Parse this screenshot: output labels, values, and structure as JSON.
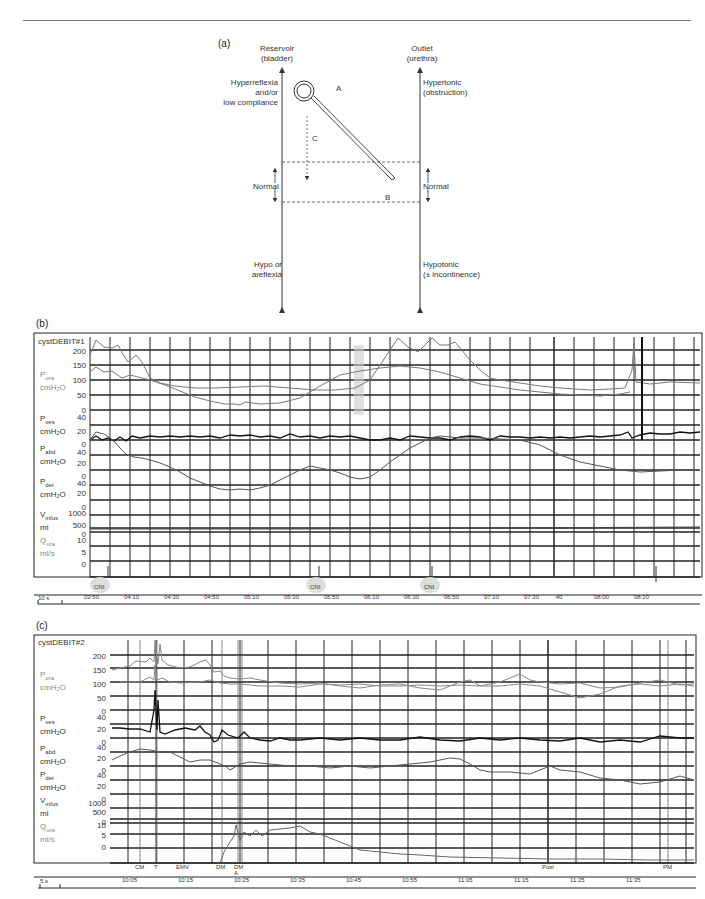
{
  "page": {
    "top_rule": true
  },
  "panel_a": {
    "label": "(a)",
    "left_axis": {
      "title_line1": "Reservoir",
      "title_line2": "(bladder)"
    },
    "right_axis": {
      "title_line1": "Outlet",
      "title_line2": "(urethra)"
    },
    "left_top": [
      "Hyperreflexia",
      "and/or",
      "low compliance"
    ],
    "left_mid": "Normal",
    "left_bottom": [
      "Hypo or",
      "areflexia"
    ],
    "right_top": [
      "Hypertonic",
      "(obstruction)"
    ],
    "right_mid": "Normal",
    "right_bottom": [
      "Hypotonic",
      "(± incontinence)"
    ],
    "markers": {
      "A": "A",
      "B": "B",
      "C": "C"
    }
  },
  "panel_b": {
    "label": "(b)",
    "recording_title": "cystDEBIT#1",
    "channels": [
      {
        "name": "P",
        "sub": "ura",
        "unit": "cmH₂O",
        "ticks": [
          "200",
          "150",
          "100",
          "50",
          "0"
        ],
        "color": "#888888"
      },
      {
        "name": "P",
        "sub": "ves",
        "unit": "cmH₂O",
        "ticks": [
          "40",
          "20",
          "0"
        ],
        "color": "#888888"
      },
      {
        "name": "P",
        "sub": "abd",
        "unit": "cmH₂O",
        "ticks": [
          "40",
          "20",
          "0"
        ],
        "color": "#222222"
      },
      {
        "name": "P",
        "sub": "det",
        "unit": "cmH₂O",
        "ticks": [
          "40",
          "20",
          "0"
        ],
        "color": "#222222"
      },
      {
        "name": "V",
        "sub": "infus",
        "unit": "ml",
        "ticks": [
          "1000",
          "500",
          "0"
        ],
        "color": "#222222"
      },
      {
        "name": "Q",
        "sub": "ura",
        "unit": "ml/s",
        "ticks": [
          "10",
          "5",
          "0"
        ],
        "color": "#888888"
      }
    ],
    "events": [
      {
        "label": "CNI",
        "mark": "CNI"
      },
      {
        "label": "CNI",
        "mark": "CNI"
      },
      {
        "label": "CNI",
        "mark": "CNI"
      },
      {
        "label": "TOUX",
        "mark": "TOUX"
      }
    ],
    "scale_bar": "10 s",
    "time_ticks": [
      "03:50",
      "04:10",
      "04:30",
      "04:50",
      "05:10",
      "05:30",
      "05:50",
      "06:10",
      "06:30",
      "06:50",
      "07:10",
      "07:30",
      ":40",
      "08:00",
      "08:20"
    ],
    "annotation_vertical": "ALITOBEDIENT"
  },
  "panel_c": {
    "label": "(c)",
    "recording_title": "cystDEBIT#2",
    "channels": [
      {
        "name": "P",
        "sub": "ura",
        "unit": "cmH₂O",
        "ticks": [
          "200",
          "150",
          "100",
          "50",
          "0"
        ]
      },
      {
        "name": "P",
        "sub": "ves",
        "unit": "cmH₂O",
        "ticks": [
          "40",
          "20",
          "0"
        ]
      },
      {
        "name": "P",
        "sub": "abd",
        "unit": "cmH₂O",
        "ticks": [
          "40",
          "20",
          "0"
        ]
      },
      {
        "name": "P",
        "sub": "det",
        "unit": "cmH₂O",
        "ticks": [
          "40",
          "20",
          "0"
        ]
      },
      {
        "name": "V",
        "sub": "infus",
        "unit": "ml",
        "ticks": [
          "1000",
          "500",
          "0"
        ]
      },
      {
        "name": "Q",
        "sub": "ura",
        "unit": "ml/s",
        "ticks": [
          "10",
          "5",
          "0"
        ]
      }
    ],
    "events": [
      "CM",
      "T",
      "TOUX",
      "EMV",
      "BESOIN",
      "DM",
      "DM A",
      "Post",
      "PM"
    ],
    "scale_bar": "5 s",
    "time_ticks": [
      "10:05",
      "10:15",
      "10:25",
      "10:35",
      "10:45",
      "10:55",
      "11:05",
      "11:15",
      "11:25",
      "11:35"
    ]
  }
}
